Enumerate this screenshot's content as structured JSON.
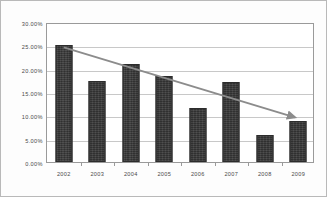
{
  "chart_data": {
    "type": "bar",
    "title": "",
    "xlabel": "",
    "ylabel": "",
    "categories": [
      "2002",
      "2003",
      "2004",
      "2005",
      "2006",
      "2007",
      "2008",
      "2009"
    ],
    "values": [
      25.0,
      17.3,
      21.0,
      18.4,
      11.6,
      17.1,
      5.7,
      8.7
    ],
    "value_format": "percent",
    "ylim": [
      0,
      30
    ],
    "ytick_step": 5,
    "ytick_labels": [
      "0.00%",
      "5.00%",
      "10.00%",
      "15.00%",
      "20.00%",
      "25.00%",
      "30.00%"
    ],
    "ytick_values": [
      0,
      5,
      10,
      15,
      20,
      25,
      30
    ],
    "grid": true,
    "legend": "none",
    "series": [
      {
        "name": "value",
        "values": [
          25.0,
          17.3,
          21.0,
          18.4,
          11.6,
          17.1,
          5.7,
          8.7
        ]
      }
    ],
    "annotations": [
      {
        "type": "trendline-arrow",
        "label": "",
        "start": {
          "x": "2002",
          "y": 25.0
        },
        "end": {
          "x": "2009",
          "y": 10.0
        },
        "color": "#8c8c8c",
        "arrowhead": "end"
      }
    ],
    "colors": {
      "bar": "#3a3a3a",
      "bar_border": "#2c2c2c",
      "gridline": "#c8c8c8",
      "frame": "#9a9a9a",
      "trendline": "#8c8c8c",
      "axis_text": "#4a4a4a",
      "background": "#ffffff",
      "outer_border": "#b9b9b9"
    }
  }
}
